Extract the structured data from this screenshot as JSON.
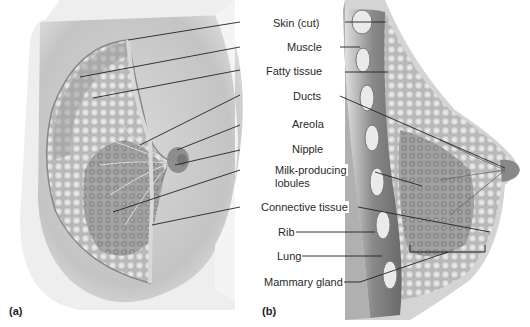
{
  "figure": {
    "panels": [
      {
        "id": "a",
        "label": "(a)",
        "description": "Cutaway anterior view of breast"
      },
      {
        "id": "b",
        "label": "(b)",
        "description": "Sagittal section of breast"
      }
    ],
    "labels": [
      {
        "key": "skin",
        "text": "Skin (cut)"
      },
      {
        "key": "muscle",
        "text": "Muscle"
      },
      {
        "key": "fatty",
        "text": "Fatty tissue"
      },
      {
        "key": "ducts",
        "text": "Ducts"
      },
      {
        "key": "areola",
        "text": "Areola"
      },
      {
        "key": "nipple",
        "text": "Nipple"
      },
      {
        "key": "lobules_1",
        "text": "Milk-producing"
      },
      {
        "key": "lobules_2",
        "text": "lobules"
      },
      {
        "key": "connective",
        "text": "Connective tissue"
      },
      {
        "key": "rib",
        "text": "Rib"
      },
      {
        "key": "lung",
        "text": "Lung"
      },
      {
        "key": "mammary",
        "text": "Mammary gland"
      }
    ]
  },
  "colors": {
    "background": "#ffffff",
    "tissue_light": "#cfcfcf",
    "tissue_mid": "#a8a8a8",
    "tissue_dark": "#6e6e6e",
    "leader_line": "#222222"
  }
}
